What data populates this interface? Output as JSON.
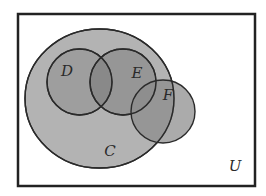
{
  "diagram": {
    "type": "venn",
    "universe": {
      "label": "U",
      "rect": {
        "x": 18,
        "y": 14,
        "width": 237,
        "height": 172
      },
      "fill": "#ffffff",
      "stroke": "#222222",
      "label_pos": {
        "x": 235,
        "y": 171
      }
    },
    "sets": [
      {
        "id": "C",
        "label": "C",
        "shape": {
          "cx": 99.5,
          "cy": 98.5,
          "rx": 74.5,
          "ry": 69.5
        },
        "fill": "#b3b3b3",
        "label_pos": {
          "x": 110,
          "y": 156
        }
      },
      {
        "id": "D",
        "label": "D",
        "shape": {
          "cx": 79.5,
          "cy": 82,
          "rx": 32.5,
          "ry": 33
        },
        "fill": "#6e6e6e",
        "label_pos": {
          "x": 67,
          "y": 76
        }
      },
      {
        "id": "E",
        "label": "E",
        "shape": {
          "cx": 123,
          "cy": 82,
          "rx": 33,
          "ry": 33
        },
        "fill": "#666666",
        "label_pos": {
          "x": 137,
          "y": 78
        }
      },
      {
        "id": "F",
        "label": "F",
        "shape": {
          "cx": 163,
          "cy": 111.5,
          "rx": 32,
          "ry": 31.5
        },
        "fill": "#8a8a8a",
        "label_pos": {
          "x": 168,
          "y": 100
        }
      }
    ],
    "relations": {
      "D_subset_of": "C",
      "E_subset_of": "C",
      "D_intersects_E": true,
      "E_intersects_F": true,
      "F_partially_in": "C"
    },
    "colors": {
      "stroke": "#2a2a2a",
      "region_C_only": "#b5b5b5",
      "region_D": "#9a9a9a",
      "region_D_and_E": "#8a8a8a",
      "region_E": "#8c8c8c",
      "region_F_outside_C": "#9e9e9e"
    }
  }
}
